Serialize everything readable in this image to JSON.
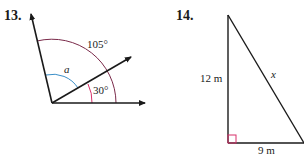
{
  "problems": [
    {
      "number": "13.",
      "figure": "angle-diagram",
      "labels": {
        "outer_angle": "105°",
        "unknown_angle": "a",
        "inner_angle": "30°"
      },
      "colors": {
        "outer_arc": "#7a2a4a",
        "unknown_arc": "#3a8fc8",
        "inner_arc": "#d8306a",
        "rays": "#1a1a1a"
      }
    },
    {
      "number": "14.",
      "figure": "right-triangle",
      "labels": {
        "vertical_side": "12 m",
        "hypotenuse": "x",
        "base": "9 m"
      },
      "colors": {
        "right_angle_marker": "#d8306a",
        "sides": "#1a1a1a"
      }
    }
  ]
}
